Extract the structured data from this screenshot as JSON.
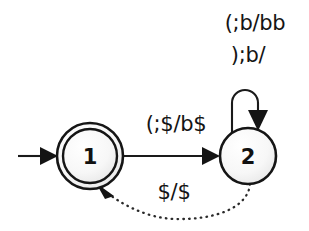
{
  "diagram": {
    "background_color": "#ffffff",
    "stroke_color": "#151515",
    "node_fill_color": "#f4f4f4",
    "states": [
      {
        "id": "1",
        "label": "1",
        "kind": "accepting",
        "shape": "double-circle",
        "cx": 90,
        "cy": 156,
        "r_outer": 33,
        "r_inner": 27
      },
      {
        "id": "2",
        "label": "2",
        "kind": "normal",
        "shape": "circle",
        "cx": 248,
        "cy": 156,
        "r_outer": 28,
        "r_inner": 0
      }
    ],
    "start_arrow": {
      "name": "start-arrow",
      "from_x": 18,
      "to_x": 56,
      "y": 156
    },
    "transitions": [
      {
        "id": "t1-2",
        "from": "1",
        "to": "2",
        "label": "(;$/b$",
        "style": "solid",
        "label_x": 176,
        "label_y": 131
      },
      {
        "id": "t2-2",
        "from": "2",
        "to": "2",
        "label_line1": "(;b/bb",
        "label_line2": ");b/",
        "style": "solid-self-loop",
        "label_x": 255,
        "label_y1": 30,
        "label_y2": 62
      },
      {
        "id": "t2-1",
        "from": "2",
        "to": "1",
        "label": "$/$",
        "style": "dotted",
        "label_x": 174,
        "label_y": 199
      }
    ]
  }
}
